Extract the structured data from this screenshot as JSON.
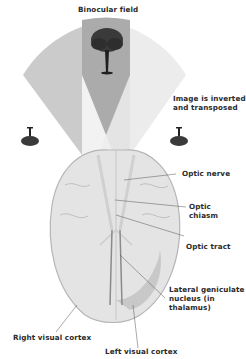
{
  "diagram": {
    "labels": {
      "binocular_field": "Binocular field",
      "image_inverted_line1": "Image is inverted",
      "image_inverted_line2": "and transposed",
      "optic_nerve": "Optic nerve",
      "optic_chiasm_line1": "Optic",
      "optic_chiasm_line2": "chiasm",
      "optic_tract": "Optic tract",
      "lgn_line1": "Lateral geniculate",
      "lgn_line2": "nucleus (in",
      "lgn_line3": "thalamus)",
      "right_visual_cortex": "Right visual cortex",
      "left_visual_cortex": "Left visual cortex"
    },
    "icons": [
      "tree-upright-icon",
      "tree-inverted-left-icon",
      "tree-inverted-right-icon",
      "brain-illustration"
    ],
    "colors": {
      "visual_field_gray": "#c9c9c9",
      "binocular_overlap": "#a9a9a9",
      "light_cone": "#ededed",
      "brain_fill": "#e4e4e4",
      "brain_stroke": "#b5b5b5",
      "leader_line": "#555555",
      "text": "#2b2b2b"
    }
  }
}
